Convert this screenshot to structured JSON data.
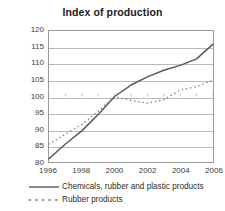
{
  "chart_data": {
    "type": "line",
    "title": "Index of production",
    "xlabel": "",
    "ylabel": "",
    "xlim": [
      1996,
      2006
    ],
    "ylim": [
      80,
      120
    ],
    "ytick_step": 5,
    "grid": true,
    "legend_position": "bottom-left",
    "x": [
      1996,
      1997,
      1998,
      1999,
      2000,
      2001,
      2002,
      2003,
      2004,
      2005,
      2006
    ],
    "xticks": [
      "1996",
      "1998",
      "2000",
      "2002",
      "2004",
      "2006"
    ],
    "yticks": [
      "80",
      "85",
      "90",
      "95",
      "100",
      "105",
      "110",
      "115",
      "120"
    ],
    "series": [
      {
        "name": "Chemicals, rubber and plastic products",
        "style": "solid",
        "color": "#595959",
        "values": [
          81.0,
          85.5,
          89.5,
          94.5,
          100.0,
          103.5,
          106.0,
          108.0,
          109.5,
          111.5,
          116.0
        ]
      },
      {
        "name": "Rubber products",
        "style": "dotted",
        "color": "#7a7a7a",
        "values": [
          85.5,
          88.5,
          91.5,
          95.5,
          100.0,
          98.8,
          98.0,
          99.0,
          102.0,
          103.0,
          105.0
        ]
      }
    ]
  },
  "legend": {
    "entries": [
      {
        "label": "Chemicals, rubber and plastic products"
      },
      {
        "label": "Rubber products"
      }
    ]
  }
}
